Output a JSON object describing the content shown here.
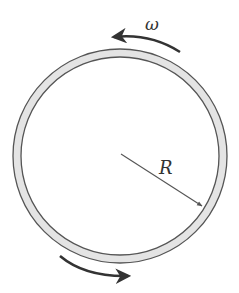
{
  "diagram": {
    "ring": {
      "cx": 120,
      "cy": 156,
      "r_outer": 107,
      "r_inner": 99,
      "fill": "#e2e2e2",
      "stroke": "#555555"
    },
    "labels": {
      "omega": "ω",
      "radius": "R"
    },
    "radius_line": {
      "x1": 121,
      "y1": 154,
      "x2": 202,
      "y2": 206
    },
    "arrows": [
      {
        "name": "top-rotation-arrow",
        "direction": "counterclockwise"
      },
      {
        "name": "bottom-rotation-arrow",
        "direction": "counterclockwise"
      }
    ]
  }
}
